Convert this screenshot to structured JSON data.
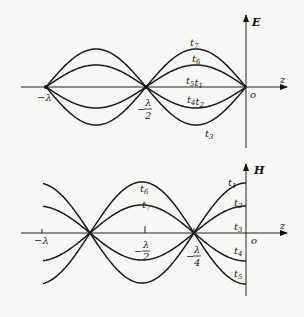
{
  "top_panel": {
    "axis_vertical_label": "E",
    "axis_horizontal_label": "z",
    "origin_label": "o",
    "ticks": [
      {
        "label": "−λ",
        "x": 46
      },
      {
        "label_num": "λ",
        "label_den": "2",
        "prefix": "−",
        "x": 146
      }
    ],
    "curve_labels": [
      {
        "text": "t",
        "sub": "7",
        "x": 190,
        "y": 46
      },
      {
        "text": "t",
        "sub": "6",
        "x": 192,
        "y": 62
      },
      {
        "text": "t",
        "sub": "5",
        "text2": "t",
        "sub2": "1",
        "x": 186,
        "y": 84
      },
      {
        "text": "t",
        "sub": "4",
        "text2": "t",
        "sub2": "2",
        "x": 187,
        "y": 103
      },
      {
        "text": "t",
        "sub": "3",
        "x": 205,
        "y": 137
      }
    ],
    "amplitudes": {
      "t7": 38,
      "t6": 22,
      "t5_t1": 0,
      "t4_t2": -21,
      "t3": -38
    }
  },
  "bottom_panel": {
    "axis_vertical_label": "H",
    "axis_horizontal_label": "z",
    "origin_label": "o",
    "ticks": [
      {
        "label": "−λ",
        "x": 42
      },
      {
        "label_num": "λ",
        "label_den": "2",
        "prefix": "−",
        "x": 145
      },
      {
        "label_num": "λ",
        "label_den": "4",
        "prefix": "−",
        "x": 194
      }
    ],
    "curve_labels": [
      {
        "text": "t",
        "sub": "6",
        "x": 140,
        "y": 192
      },
      {
        "text": "t",
        "sub": "7",
        "x": 142,
        "y": 208
      },
      {
        "text": "t",
        "sub": "1",
        "x": 228,
        "y": 186
      },
      {
        "text": "t",
        "sub": "2",
        "x": 234,
        "y": 206
      },
      {
        "text": "t",
        "sub": "3",
        "x": 234,
        "y": 230
      },
      {
        "text": "t",
        "sub": "4",
        "x": 234,
        "y": 254
      },
      {
        "text": "t",
        "sub": "5",
        "x": 234,
        "y": 277
      }
    ],
    "amplitudes": {
      "t1": 50,
      "t2": 27,
      "t3": 0,
      "t4": -28,
      "t5": -51,
      "t6": -42,
      "t7": -26
    }
  }
}
